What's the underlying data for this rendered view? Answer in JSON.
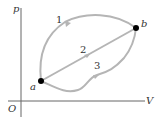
{
  "diagram": {
    "type": "pV-diagram",
    "axes": {
      "y_label": "p",
      "x_label": "V",
      "origin_label": "O"
    },
    "points": {
      "a": "a",
      "b": "b"
    },
    "paths": [
      {
        "label": "1",
        "description": "curved upper path from a to b"
      },
      {
        "label": "2",
        "description": "straight line from a to b"
      },
      {
        "label": "3",
        "description": "wavy lower path from a to b"
      }
    ],
    "colors": {
      "path": "#b0b0b0",
      "axis": "#555555",
      "point": "#000000",
      "text": "#333333"
    }
  }
}
